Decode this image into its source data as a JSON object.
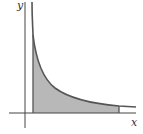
{
  "diagram": {
    "axis_labels": {
      "x": "x",
      "y": "y"
    },
    "curve": "decreasing hyperbola-like curve (y = 1/x shape)",
    "shaded_region": "area under curve between left vertical boundary and right vertical boundary",
    "colors": {
      "fill": "#b8b8b8",
      "stroke": "#555555",
      "axis": "#444444"
    }
  }
}
